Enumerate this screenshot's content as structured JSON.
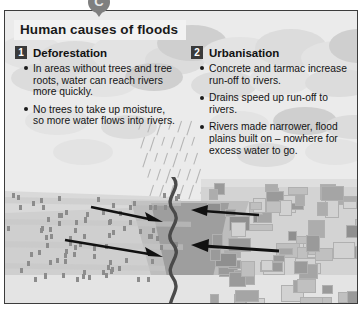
{
  "marker": {
    "label": "C",
    "icon": "pointer-marker-icon"
  },
  "title": "Human causes of floods",
  "columns": [
    {
      "number": "1",
      "heading": "Deforestation",
      "bullets": [
        "In areas without trees and tree roots, water can reach rivers more quickly.",
        "No trees to take up moisture, so more water flows into rivers."
      ]
    },
    {
      "number": "2",
      "heading": "Urbanisation",
      "bullets": [
        "Concrete and tarmac increase run-off to rivers.",
        "Drains speed up run-off to rivers.",
        "Rivers made narrower, flood plains built on – nowhere for excess water to go."
      ]
    }
  ],
  "illustration": {
    "left_scene": "deforested-hillside-with-stumps",
    "right_scene": "urban-area-with-buildings",
    "centre_scene": "river-in-valley",
    "weather": "rain-cloud-with-falling-rain",
    "arrows_left": "runoff-arrows-pointing-right-to-river",
    "arrows_right": "runoff-arrows-pointing-left-to-river"
  },
  "colors": {
    "frame_border": "#3c3c3c",
    "panel_bg": "#e8e8e8",
    "title_plate": "#f2f2f2",
    "number_box": "#3a3a3a",
    "river": "#4a4a4a",
    "arrow": "#111111",
    "marker": "#7f7f7f"
  }
}
